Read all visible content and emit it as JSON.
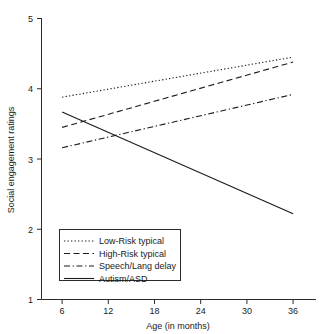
{
  "chart_data": {
    "type": "line",
    "title": "",
    "xlabel": "Age (in months)",
    "ylabel": "Social engagement ratings",
    "xlim": [
      3,
      39
    ],
    "ylim": [
      1,
      5
    ],
    "xticks": [
      6,
      12,
      18,
      24,
      30,
      36
    ],
    "xtick_labels": [
      "6",
      "12",
      "18",
      "24",
      "30",
      "36"
    ],
    "yticks": [
      1,
      2,
      3,
      4,
      5
    ],
    "ytick_labels": [
      "1",
      "2",
      "3",
      "4",
      "5"
    ],
    "grid": false,
    "legend_position": "lower left",
    "x": [
      6,
      36
    ],
    "series": [
      {
        "name": "Low-Risk typical",
        "style": "dotted",
        "values": [
          3.88,
          4.45
        ]
      },
      {
        "name": "High-Risk typical",
        "style": "dashed",
        "values": [
          3.45,
          4.38
        ]
      },
      {
        "name": "Speech/Lang delay",
        "style": "dash-dot",
        "values": [
          3.16,
          3.92
        ]
      },
      {
        "name": "Autism/ASD",
        "style": "solid",
        "values": [
          3.67,
          2.22
        ]
      }
    ]
  },
  "axes": {
    "x_title": "Age (in months)",
    "y_title": "Social engagement ratings",
    "x_tick_labels": [
      "6",
      "12",
      "18",
      "24",
      "30",
      "36"
    ],
    "y_tick_labels": [
      "5",
      "4",
      "3",
      "2",
      "1"
    ]
  },
  "legend": {
    "items": [
      {
        "label": "Low-Risk typical"
      },
      {
        "label": "High-Risk typical"
      },
      {
        "label": "Speech/Lang delay"
      },
      {
        "label": "Autism/ASD"
      }
    ]
  },
  "colors": {
    "ink": "#1a1a1a",
    "axis": "#2b2b2b",
    "background": "#ffffff"
  }
}
